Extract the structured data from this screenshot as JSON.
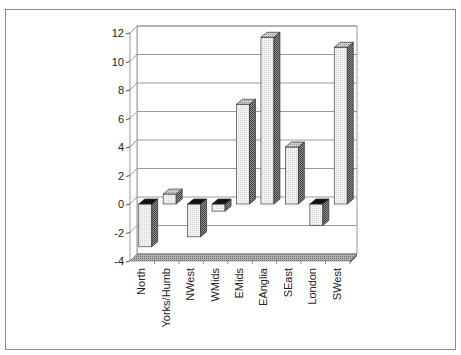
{
  "chart_data": {
    "type": "bar",
    "style": "3d-column",
    "title": "",
    "xlabel": "",
    "ylabel": "",
    "categories": [
      "North",
      "Yorks/Humb",
      "NWest",
      "WMids",
      "EMids",
      "EAnglia",
      "SEast",
      "London",
      "SWest"
    ],
    "values": [
      -3.0,
      0.7,
      -2.3,
      -0.5,
      7.0,
      11.7,
      4.0,
      -1.5,
      11.0
    ],
    "ylim": [
      -4,
      12
    ],
    "yticks": [
      -4,
      -2,
      0,
      2,
      4,
      6,
      8,
      10,
      12
    ],
    "ytick_labels": [
      "-4",
      "-2",
      "0",
      "2",
      "4",
      "6",
      "8",
      "10",
      "12"
    ],
    "grid": true,
    "legend": null
  },
  "colors": {
    "bar_front": "#ececec",
    "bar_side": "#6a6a6a",
    "bar_top_positive": "#b8b8b8",
    "bar_top_negative": "#111111",
    "floor": "#9a9a9a",
    "gridline": "#9a9a9a",
    "frame": "#8a8a8a"
  }
}
